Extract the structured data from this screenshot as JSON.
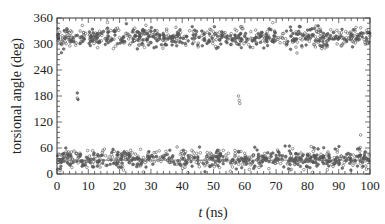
{
  "chart_data": {
    "type": "scatter",
    "title": "",
    "xlabel_italic": "t",
    "xlabel_rest": " (ns)",
    "xlabel": "t (ns)",
    "ylabel": "torsional angle (deg)",
    "xlim": [
      0,
      100
    ],
    "ylim": [
      0,
      360
    ],
    "xticks": [
      0,
      10,
      20,
      30,
      40,
      50,
      60,
      70,
      80,
      90,
      100
    ],
    "yticks": [
      0,
      60,
      120,
      180,
      240,
      300,
      360
    ],
    "grid": false,
    "legend": null,
    "reference_line_y": 32,
    "series": [
      {
        "name": "upper cluster",
        "description": "Dense band of points spanning t=0-100 ns centered ~315 deg (spread ~290-355 deg)",
        "center": 315,
        "spread": 18
      },
      {
        "name": "lower cluster",
        "description": "Dense band of points spanning t=0-100 ns centered ~35 deg (spread ~0-70 deg)",
        "center": 35,
        "spread": 16
      },
      {
        "name": "isolated transitions",
        "points": [
          [
            6.5,
            187
          ],
          [
            6.5,
            175
          ],
          [
            6.7,
            172
          ],
          [
            58,
            180
          ],
          [
            58.2,
            170
          ],
          [
            58.4,
            163
          ],
          [
            97,
            90
          ]
        ]
      }
    ]
  },
  "colors": {
    "marker": "#555555",
    "axis": "#333333",
    "refline": "#666666"
  }
}
